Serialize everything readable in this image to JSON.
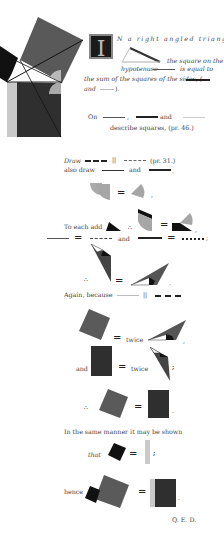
{
  "page": {
    "colors": {
      "dark": "#1f1f1f",
      "mid": "#555555",
      "grey": "#777777",
      "light": "#a8a8a8",
      "pale": "#c8c8c8",
      "white": "#ffffff"
    }
  },
  "intro": {
    "drop_cap": "I",
    "line1": "N a right angled triangle",
    "line2": "the square on the",
    "line3_a": "hypotenuse",
    "line3_b": "is equal to",
    "line4": "the sum of the squares of the sides, (",
    "line5_a": "and",
    "line5_b": ")."
  },
  "construction": {
    "on_label": "On",
    "comma": ",",
    "and_label": "and",
    "describe": "describe squares, (pr. 46.)"
  },
  "steps": {
    "draw": "Draw",
    "parallel": "||",
    "pr31": "(pr. 31.)",
    "also_draw": "also draw",
    "and1": "and",
    "period": ".",
    "eq_comma": ",",
    "to_each_add": "To each add",
    "therefore": "∴",
    "equals": "=",
    "and2": "and",
    "semicolon": ";",
    "again_because": "Again, because",
    "twice1": "twice",
    "and3": "and",
    "twice2": "twice",
    "same_manner": "In the same manner it may be shown",
    "that": "that",
    "hence": "hence",
    "qed": "Q. E. D."
  }
}
